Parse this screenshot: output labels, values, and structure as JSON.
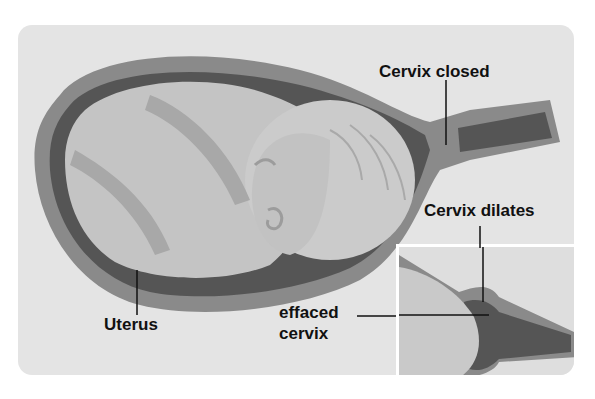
{
  "diagram": {
    "type": "labeled medical illustration",
    "labels": {
      "cervix_closed": "Cervix closed",
      "cervix_dilates": "Cervix dilates",
      "uterus": "Uterus",
      "effaced_cervix_line1": "effaced",
      "effaced_cervix_line2": "cervix"
    },
    "colors": {
      "background": "#ffffff",
      "panel": "#e4e4e4",
      "uterus_wall": "#8a8a8a",
      "uterus_cavity": "#555555",
      "fetus": "#c4c4c4",
      "fetus_shadow": "#a8a8a8",
      "label_text": "#111111"
    }
  }
}
